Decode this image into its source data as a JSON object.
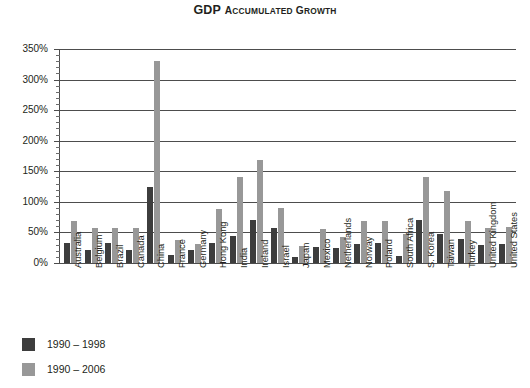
{
  "chart_data": {
    "type": "bar",
    "title_first_word": "GDP",
    "title_rest": "Accumulated Growth",
    "xlabel": "",
    "ylabel": "",
    "ylim": [
      0,
      350
    ],
    "ytick_values": [
      0,
      50,
      100,
      150,
      200,
      250,
      300,
      350
    ],
    "ytick_labels": [
      "0%",
      "50%",
      "100%",
      "150%",
      "200%",
      "250%",
      "300%",
      "350%"
    ],
    "minor_tick_step": 10,
    "grid": true,
    "grid_axis": "y",
    "legend_position": "below-left",
    "categories": [
      "Australia",
      "Belgium",
      "Brazil",
      "Canada",
      "China",
      "France",
      "Germany",
      "Hong Kong",
      "India",
      "Ireland",
      "Israel",
      "Japan",
      "Mexico",
      "Netherlands",
      "Norway",
      "Poland",
      "South Africa",
      "S. Korea",
      "Taiwan",
      "Turkey",
      "United Kingdom",
      "United States"
    ],
    "series": [
      {
        "name": "1990 – 1998",
        "color": "#3d3d3d",
        "values": [
          32,
          22,
          32,
          21,
          125,
          13,
          22,
          33,
          44,
          70,
          57,
          10,
          27,
          25,
          31,
          32,
          12,
          70,
          48,
          40,
          30,
          31
        ]
      },
      {
        "name": "1990 – 2006",
        "color": "#989898",
        "values": [
          68,
          57,
          58,
          57,
          330,
          37,
          31,
          88,
          140,
          168,
          90,
          28,
          56,
          42,
          68,
          68,
          48,
          140,
          118,
          69,
          58,
          59
        ]
      }
    ]
  },
  "legend": {
    "items": [
      {
        "label": "1990 – 1998",
        "swatch": "dark"
      },
      {
        "label": "1990 – 2006",
        "swatch": "light"
      }
    ]
  },
  "colors": {
    "series_dark": "#3d3d3d",
    "series_light": "#989898",
    "axis": "#4d4d4d",
    "text": "#231f20",
    "background": "#ffffff"
  }
}
